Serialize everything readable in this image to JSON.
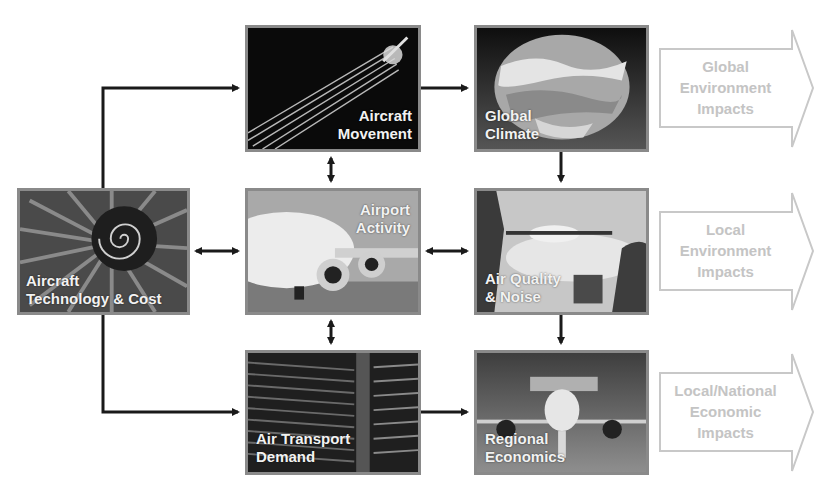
{
  "colors": {
    "box_border": "#8a8a8a",
    "arrow": "#1a1a1a",
    "impact_outline": "#c8c8c8",
    "impact_text": "#c4c4c4",
    "label_text": "#f2f2f2"
  },
  "nodes": {
    "aircraft_tech": {
      "label_l1": "Aircraft",
      "label_l2": "Technology & Cost",
      "image": "turbofan-engine-icon"
    },
    "aircraft_movement": {
      "label_l1": "Aircraft",
      "label_l2": "Movement",
      "image": "contrail-icon"
    },
    "airport_activity": {
      "label_l1": "Airport",
      "label_l2": "Activity",
      "image": "airliner-on-ground-icon"
    },
    "air_transport_demand": {
      "label_l1": "Air Transport",
      "label_l2": "Demand",
      "image": "departure-board-icon"
    },
    "global_climate": {
      "label_l1": "Global",
      "label_l2": "Climate",
      "image": "globe-icon"
    },
    "air_quality_noise": {
      "label_l1": "Air Quality",
      "label_l2": "& Noise",
      "image": "landing-aircraft-icon"
    },
    "regional_economics": {
      "label_l1": "Regional",
      "label_l2": "Economics",
      "image": "aircraft-front-view-icon"
    }
  },
  "impacts": [
    {
      "l1": "Global",
      "l2": "Environment",
      "l3": "Impacts"
    },
    {
      "l1": "Local",
      "l2": "Environment",
      "l3": "Impacts"
    },
    {
      "l1": "Local/National",
      "l2": "Economic",
      "l3": "Impacts"
    }
  ]
}
